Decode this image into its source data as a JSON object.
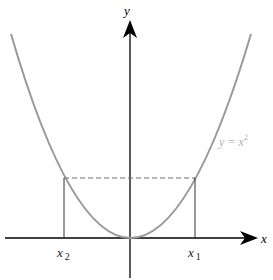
{
  "figure": {
    "curve_label": "y = x",
    "curve_label_exp": "2",
    "x_axis_label": "x",
    "y_axis_label": "y",
    "x1_label": "x",
    "x1_sub": "1",
    "x2_label": "x",
    "x2_sub": "2",
    "colors": {
      "curve": "#9a9a9a",
      "axes": "#000000",
      "dashed": "#707070",
      "label_curve": "#b0b0b0"
    }
  }
}
